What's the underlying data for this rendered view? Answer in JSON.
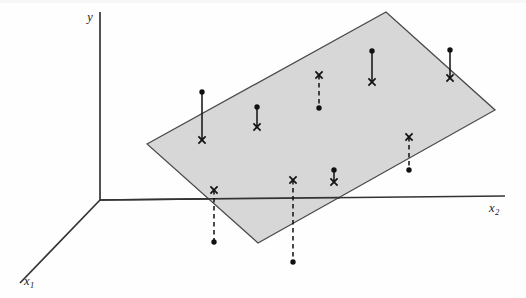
{
  "figure": {
    "type": "3d-regression-plane-diagram",
    "background_color": "#fefefe",
    "plane_fill_color": "#d7d7d7",
    "plane_stroke_color": "#4a4a4a",
    "axis_color": "#333333",
    "marker_color": "#111111"
  },
  "axes": {
    "y": {
      "label": "y",
      "label_x": 90,
      "label_y": 21,
      "from": [
        100,
        200
      ],
      "to": [
        100,
        12
      ]
    },
    "x2": {
      "label": "x",
      "subscript": "2",
      "label_x": 489,
      "label_y": 212,
      "from": [
        100,
        200
      ],
      "to": [
        505,
        196
      ]
    },
    "x1": {
      "label": "x",
      "subscript": "1",
      "label_x": 28,
      "label_y": 285,
      "from": [
        100,
        200
      ],
      "to": [
        20,
        283
      ]
    },
    "origin": [
      100,
      200
    ]
  },
  "plane": {
    "corners": [
      [
        147,
        144
      ],
      [
        386,
        12
      ],
      [
        495,
        110
      ],
      [
        258,
        243
      ]
    ],
    "opacity": 1
  },
  "observations": [
    {
      "id": "obs-1",
      "x": 202,
      "dot_y": 92,
      "cross_y": 140,
      "style": "solid",
      "residual_sign": "positive"
    },
    {
      "id": "obs-2",
      "x": 257,
      "dot_y": 107,
      "cross_y": 127,
      "style": "solid",
      "residual_sign": "positive"
    },
    {
      "id": "obs-3",
      "x": 319,
      "dot_y": 108,
      "cross_y": 75,
      "style": "dashed",
      "residual_sign": "negative"
    },
    {
      "id": "obs-4",
      "x": 372,
      "dot_y": 51,
      "cross_y": 82,
      "style": "solid",
      "residual_sign": "positive"
    },
    {
      "id": "obs-5",
      "x": 450,
      "dot_y": 50,
      "cross_y": 78,
      "style": "solid",
      "residual_sign": "positive"
    },
    {
      "id": "obs-6",
      "x": 409,
      "dot_y": 170,
      "cross_y": 137,
      "style": "dashed",
      "residual_sign": "negative"
    },
    {
      "id": "obs-7",
      "x": 334,
      "dot_y": 170,
      "cross_y": 182,
      "style": "solid",
      "residual_sign": "positive"
    },
    {
      "id": "obs-8",
      "x": 293,
      "dot_y": 262,
      "cross_y": 180,
      "style": "dashed",
      "residual_sign": "negative"
    },
    {
      "id": "obs-9",
      "x": 214,
      "dot_y": 242,
      "cross_y": 190,
      "style": "dashed",
      "residual_sign": "negative"
    }
  ],
  "marker_legend": {
    "dot": "observed value",
    "cross": "fitted value on plane"
  },
  "chart_data": {
    "type": "scatter",
    "title": "",
    "xlabel": "x₁",
    "ylabel": "y",
    "zlabel": "x₂",
    "grid": false,
    "legend": "none",
    "series": [
      {
        "name": "observed",
        "marker": "dot",
        "points": [
          [
            202,
            92
          ],
          [
            257,
            107
          ],
          [
            319,
            108
          ],
          [
            372,
            51
          ],
          [
            450,
            50
          ],
          [
            409,
            170
          ],
          [
            334,
            170
          ],
          [
            293,
            262
          ],
          [
            214,
            242
          ]
        ]
      },
      {
        "name": "fitted",
        "marker": "cross",
        "points": [
          [
            202,
            140
          ],
          [
            257,
            127
          ],
          [
            319,
            75
          ],
          [
            372,
            82
          ],
          [
            450,
            78
          ],
          [
            409,
            137
          ],
          [
            334,
            182
          ],
          [
            293,
            180
          ],
          [
            214,
            190
          ]
        ]
      }
    ],
    "residual_lengths": [
      48,
      20,
      33,
      31,
      28,
      33,
      12,
      82,
      52
    ]
  }
}
